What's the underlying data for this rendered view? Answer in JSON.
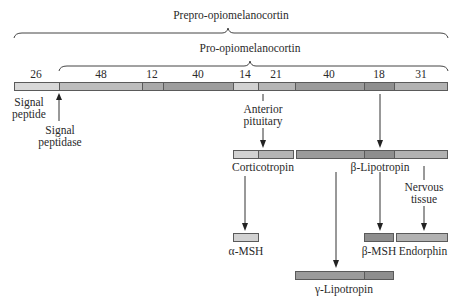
{
  "title": "Prepro-opiomelanocortin",
  "subtitle": "Pro-opiomelanocortin",
  "main_bar": {
    "segments": [
      {
        "length": "26",
        "x": 14,
        "w": 45,
        "color": "#d8d8d8"
      },
      {
        "length": "48",
        "x": 59,
        "w": 83,
        "color": "#bdbdbd"
      },
      {
        "length": "12",
        "x": 142,
        "w": 21,
        "color": "#a9a9a9"
      },
      {
        "length": "40",
        "x": 163,
        "w": 70,
        "color": "#9d9d9d"
      },
      {
        "length": "14",
        "x": 233,
        "w": 25,
        "color": "#d2d2d2"
      },
      {
        "length": "21",
        "x": 258,
        "w": 37,
        "color": "#b5b5b5"
      },
      {
        "length": "40",
        "x": 295,
        "w": 69,
        "color": "#9b9b9b"
      },
      {
        "length": "18",
        "x": 364,
        "w": 30,
        "color": "#8e8e8e"
      },
      {
        "length": "31",
        "x": 394,
        "w": 54,
        "color": "#b2b2b2"
      }
    ]
  },
  "labels": {
    "signal_peptide": "Signal\npeptide",
    "signal_peptidase": "Signal\npeptidase",
    "anterior_pituitary": "Anterior\npituitary",
    "nervous_tissue": "Nervous\ntissue",
    "corticotropin": "Corticotropin",
    "beta_lipotropin": "β-Lipotropin",
    "alpha_msh": "α-MSH",
    "beta_msh": "β-MSH",
    "endorphin": "Endorphin",
    "gamma_lipotropin": "γ-Lipotropin"
  },
  "colors": {
    "border": "#5a5a5a",
    "line": "#333333"
  }
}
